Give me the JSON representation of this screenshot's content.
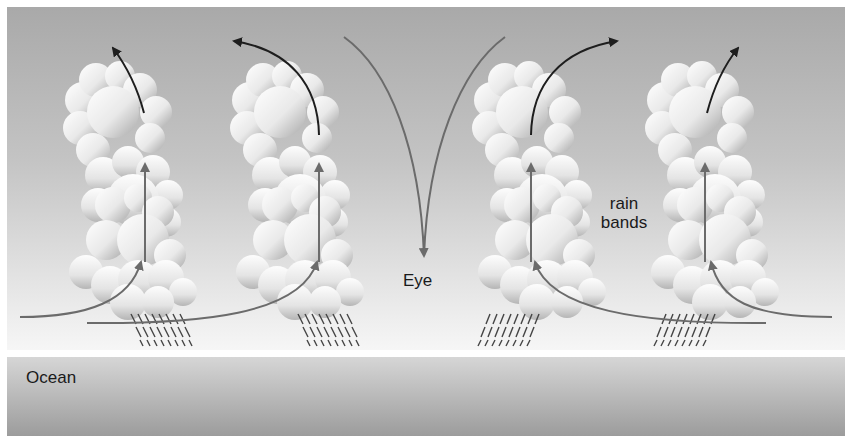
{
  "diagram": {
    "labels": {
      "eye": "Eye",
      "rain_bands_line1": "rain",
      "rain_bands_line2": "bands",
      "ocean": "Ocean"
    },
    "elements": {
      "cloud_towers": 4,
      "rain_patches": 4,
      "eye_downdraft_arrows": 2,
      "updraft_arrows": 4,
      "outflow_arrows": 4,
      "inflow_arrows": 4
    },
    "colors": {
      "sky_top": "#a9a9a9",
      "sky_bottom": "#f4f4f4",
      "ocean_top": "#d2d2d2",
      "ocean_bottom": "#9a9a9a",
      "arrow_gray": "#6b6b6b",
      "arrow_dark": "#1e1e1e",
      "text": "#1a1a1a"
    }
  }
}
